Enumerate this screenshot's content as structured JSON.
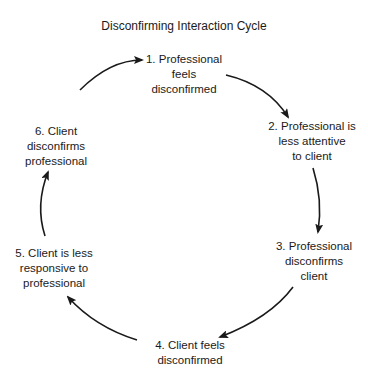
{
  "title": "Disconfirming Interaction Cycle",
  "nodes": [
    {
      "label": "1. Professional\nfeels\ndisconfirmed"
    },
    {
      "label": "2. Professional is\nless attentive\nto client"
    },
    {
      "label": "3. Professional\ndisconfirms\nclient"
    },
    {
      "label": "4. Client feels\ndisconfirmed"
    },
    {
      "label": "5. Client is less\nresponsive to\nprofessional"
    },
    {
      "label": "6. Client\ndisconfirms\nprofessional"
    }
  ],
  "colors": {
    "line": "#1a1a1a",
    "text": "#1a1a1a"
  }
}
